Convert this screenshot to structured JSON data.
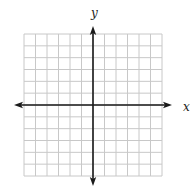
{
  "figure": {
    "type": "coordinate-plane",
    "x_axis_label": "x",
    "y_axis_label": "y",
    "grid": {
      "columns": 12,
      "rows": 12,
      "origin_col": 6,
      "origin_row": 6,
      "left": 24,
      "top": 34,
      "right": 162,
      "bottom": 176
    },
    "colors": {
      "grid_line": "#c8c8c8",
      "axis": "#1a1a1a",
      "label": "#222222",
      "background": "#ffffff"
    },
    "arrows": {
      "x_left_tip": 14,
      "x_right_tip": 172,
      "y_top_tip": 26,
      "y_bottom_tip": 186
    },
    "label_positions": {
      "x_label": [
        183,
        111
      ],
      "y_label": [
        91,
        17
      ]
    }
  }
}
